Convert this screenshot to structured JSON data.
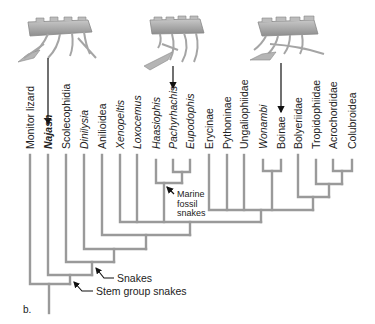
{
  "figure": {
    "panel_label": "b.",
    "taxa": [
      {
        "label": "Monitor lizard",
        "x": 30,
        "style": "normal"
      },
      {
        "label": "Najash",
        "x": 48,
        "style": "bold-italic"
      },
      {
        "label": "Scolecophidia",
        "x": 66,
        "style": "normal"
      },
      {
        "label": "Dinilysia",
        "x": 84,
        "style": "italic"
      },
      {
        "label": "Anilioidea",
        "x": 102,
        "style": "normal"
      },
      {
        "label": "Xenopeltis",
        "x": 120,
        "style": "italic"
      },
      {
        "label": "Loxocemus",
        "x": 137,
        "style": "italic"
      },
      {
        "label": "Haasiophis",
        "x": 156,
        "style": "italic"
      },
      {
        "label": "Pachyrhachis",
        "x": 173,
        "style": "italic"
      },
      {
        "label": "Eupodophis",
        "x": 190,
        "style": "italic"
      },
      {
        "label": "Erycinae",
        "x": 209,
        "style": "normal"
      },
      {
        "label": "Pythoninae",
        "x": 227,
        "style": "normal"
      },
      {
        "label": "Ungaliophiidae",
        "x": 244,
        "style": "normal"
      },
      {
        "label": "Wonambi",
        "x": 263,
        "style": "italic"
      },
      {
        "label": "Boinae",
        "x": 281,
        "style": "normal"
      },
      {
        "label": "Bolyeriidae",
        "x": 298,
        "style": "normal"
      },
      {
        "label": "Tropidophiidae",
        "x": 316,
        "style": "normal"
      },
      {
        "label": "Acrochordidae",
        "x": 333,
        "style": "normal"
      },
      {
        "label": "Colubroidea",
        "x": 352,
        "style": "normal"
      }
    ],
    "annotations": {
      "marine": "Marine\nfossil\nsnakes",
      "snakes": "Snakes",
      "stem_group": "Stem group snakes"
    },
    "skeleton_images": [
      {
        "name": "najash-skeleton",
        "points_to": "Najash"
      },
      {
        "name": "pachyrhachis-skeleton",
        "points_to": "Pachyrhachis"
      },
      {
        "name": "boinae-skeleton",
        "points_to": "Boinae"
      }
    ],
    "colors": {
      "branch": "#9a9a9a",
      "text": "#222222",
      "bone": "#a9a9a9"
    }
  }
}
